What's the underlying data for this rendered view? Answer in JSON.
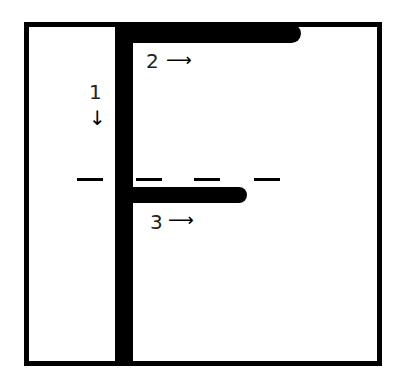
{
  "diagram": {
    "letter": "F",
    "strokes": [
      {
        "number": "1",
        "direction": "down",
        "arrow": "↓"
      },
      {
        "number": "2",
        "direction": "right",
        "arrow": "⟶"
      },
      {
        "number": "3",
        "direction": "right",
        "arrow": "⟶"
      }
    ]
  }
}
